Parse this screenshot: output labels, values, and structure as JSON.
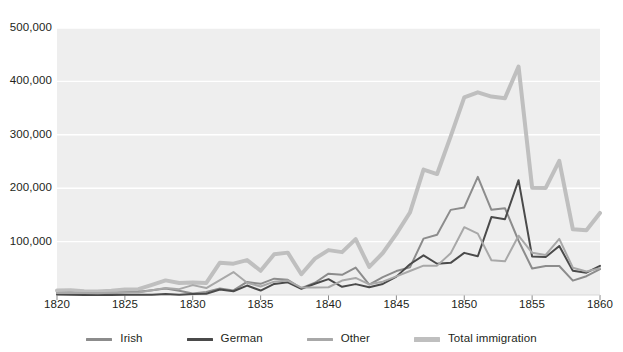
{
  "chart_data": {
    "type": "line",
    "title": "",
    "subtitle": "",
    "xlabel": "",
    "ylabel": "",
    "xlim": [
      1820,
      1860
    ],
    "ylim": [
      0,
      500000
    ],
    "grid": true,
    "grid_axis": "y",
    "legend_position": "bottom",
    "plot_background": "#eeeeee",
    "xticks": [
      1820,
      1825,
      1830,
      1835,
      1840,
      1845,
      1850,
      1855,
      1860
    ],
    "xtick_labels": [
      "1820",
      "1825",
      "1830",
      "1835",
      "1840",
      "1845",
      "1850",
      "1855",
      "1860"
    ],
    "yticks": [
      100000,
      200000,
      300000,
      400000,
      500000
    ],
    "ytick_labels": [
      "100,000",
      "200,000",
      "300,000",
      "400,000",
      "500,000"
    ],
    "x": [
      1820,
      1821,
      1822,
      1823,
      1824,
      1825,
      1826,
      1827,
      1828,
      1829,
      1830,
      1831,
      1832,
      1833,
      1834,
      1835,
      1836,
      1837,
      1838,
      1839,
      1840,
      1841,
      1842,
      1843,
      1844,
      1845,
      1846,
      1847,
      1848,
      1849,
      1850,
      1851,
      1852,
      1853,
      1854,
      1855,
      1856,
      1857,
      1858,
      1859,
      1860
    ],
    "series": [
      {
        "name": "Irish",
        "color": "#8c8c8c",
        "width": 2.0,
        "values": [
          3600,
          4000,
          3000,
          3000,
          3000,
          5000,
          6000,
          9000,
          12000,
          8000,
          2700,
          5800,
          12400,
          8600,
          24500,
          20900,
          30600,
          28500,
          12600,
          23000,
          39900,
          37800,
          51300,
          19600,
          33500,
          44800,
          51800,
          105500,
          112900,
          159400,
          164000,
          221300,
          159500,
          162600,
          101600,
          49600,
          54300,
          54400,
          26900,
          35200,
          48600
        ]
      },
      {
        "name": "German",
        "color": "#4a4a4a",
        "width": 2.0,
        "values": [
          950,
          400,
          150,
          180,
          230,
          450,
          510,
          430,
          1850,
          600,
          1980,
          2400,
          10200,
          6990,
          17700,
          8310,
          20700,
          23700,
          11700,
          21000,
          29700,
          15300,
          20400,
          14400,
          20700,
          34400,
          57600,
          74300,
          58500,
          60200,
          78900,
          72500,
          145900,
          141900,
          215000,
          71900,
          71000,
          91800,
          45300,
          41800,
          54500
        ]
      },
      {
        "name": "Other",
        "color": "#a8a8a8",
        "width": 2.0,
        "values": [
          3800,
          4300,
          3900,
          3400,
          4000,
          4900,
          4500,
          9000,
          13000,
          11000,
          18500,
          13000,
          28000,
          43000,
          23000,
          16000,
          25000,
          27000,
          14000,
          14000,
          14500,
          27000,
          32000,
          20000,
          25000,
          35000,
          45000,
          55000,
          55000,
          78000,
          127000,
          115000,
          65000,
          63000,
          111000,
          79000,
          75000,
          105000,
          51000,
          44000,
          50000
        ]
      },
      {
        "name": "Total immigration",
        "color": "#bfbfbf",
        "width": 4.0,
        "values": [
          8385,
          9127,
          6911,
          6354,
          7912,
          10199,
          10837,
          18875,
          27382,
          22520,
          23322,
          22633,
          60482,
          58640,
          65365,
          45374,
          76242,
          79340,
          38914,
          68069,
          84066,
          80289,
          104565,
          52496,
          78615,
          114371,
          154416,
          234968,
          226527,
          297024,
          369980,
          379466,
          371603,
          368645,
          427833,
          200877,
          200436,
          251306,
          123126,
          121282,
          153640
        ]
      }
    ]
  },
  "legend": {
    "items": [
      {
        "label": "Irish",
        "color": "#8c8c8c"
      },
      {
        "label": "German",
        "color": "#4a4a4a"
      },
      {
        "label": "Other",
        "color": "#a8a8a8"
      },
      {
        "label": "Total immigration",
        "color": "#bfbfbf"
      }
    ]
  }
}
